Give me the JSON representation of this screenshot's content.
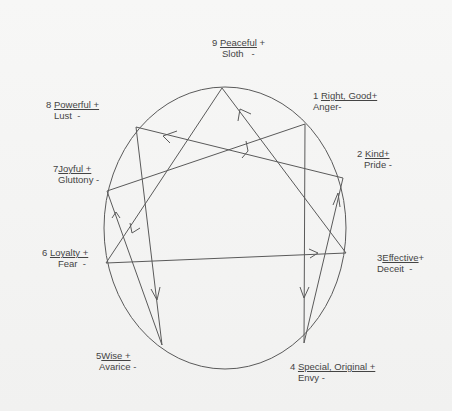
{
  "diagram": {
    "colors": {
      "line": "#555555",
      "text": "#444444",
      "background": "#f4f4f3"
    },
    "points": [
      {
        "number": "9",
        "virtue": "Peaceful",
        "virtue_suffix": " +",
        "vice": "Sloth",
        "vice_suffix": "   -"
      },
      {
        "number": "1",
        "virtue": "Right, Good+",
        "virtue_suffix": "",
        "vice": "Anger-",
        "vice_suffix": ""
      },
      {
        "number": "2",
        "virtue": "Kind+",
        "virtue_suffix": "",
        "vice": "Pride -",
        "vice_suffix": ""
      },
      {
        "number": "3",
        "virtue": "Effective",
        "virtue_suffix": "+",
        "vice": "Deceit  -",
        "vice_suffix": ""
      },
      {
        "number": "4",
        "virtue": "Special, Original +",
        "virtue_suffix": "",
        "vice": "Envy -",
        "vice_suffix": ""
      },
      {
        "number": "5",
        "virtue": "Wise +",
        "virtue_suffix": "",
        "vice": "Avarice -",
        "vice_suffix": ""
      },
      {
        "number": "6",
        "virtue": "Loyalty +",
        "virtue_suffix": "",
        "vice": "Fear  -",
        "vice_suffix": ""
      },
      {
        "number": "7",
        "virtue": "Joyful +",
        "virtue_suffix": "",
        "vice": "Gluttony -",
        "vice_suffix": ""
      },
      {
        "number": "8",
        "virtue": "Powerful +",
        "virtue_suffix": "",
        "vice": "Lust  -",
        "vice_suffix": ""
      }
    ],
    "connections": [
      {
        "from": "9",
        "to": "3",
        "arrow": "toward 9"
      },
      {
        "from": "9",
        "to": "6",
        "arrow": "toward 6"
      },
      {
        "from": "1",
        "to": "7",
        "arrow": "toward 1"
      },
      {
        "from": "1",
        "to": "4",
        "arrow": "toward 4"
      },
      {
        "from": "8",
        "to": "2",
        "arrow": "toward 8"
      },
      {
        "from": "8",
        "to": "5",
        "arrow": "toward 5"
      },
      {
        "from": "7",
        "to": "5",
        "arrow": "toward 7"
      },
      {
        "from": "6",
        "to": "3",
        "arrow": "toward 3"
      },
      {
        "from": "4",
        "to": "2",
        "arrow": "toward 2"
      }
    ]
  }
}
